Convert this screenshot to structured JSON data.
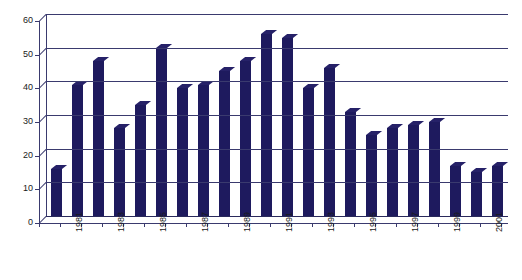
{
  "chart_data": {
    "type": "bar",
    "title": "",
    "subtitle": "",
    "xlabel": "",
    "ylabel": "",
    "categories": [
      "1980",
      "1981",
      "1982",
      "1983",
      "1984",
      "1985",
      "1986",
      "1987",
      "1988",
      "1989",
      "1990",
      "1991",
      "1992",
      "1993",
      "1994",
      "1995",
      "1996",
      "1997",
      "1998",
      "1999",
      "2000",
      "2001"
    ],
    "values": [
      14,
      39,
      46,
      26,
      33,
      50,
      38,
      39,
      43,
      46,
      54,
      53,
      38,
      44,
      31,
      24,
      26,
      27,
      28,
      15,
      13,
      15
    ],
    "ylim": [
      0,
      60
    ],
    "ytick_labels": [
      "0",
      "10",
      "20",
      "30",
      "40",
      "50",
      "60"
    ],
    "ytick_values": [
      0,
      10,
      20,
      30,
      40,
      50,
      60
    ],
    "visible_xtick_labels": [
      "1981",
      "1983",
      "1985",
      "1987",
      "1989",
      "1991",
      "1993",
      "1995",
      "1997",
      "1999",
      "2001"
    ],
    "grid": true,
    "legend": false,
    "legend_position": "none",
    "series": [
      {
        "name": "",
        "values": [
          14,
          39,
          46,
          26,
          33,
          50,
          38,
          39,
          43,
          46,
          54,
          53,
          38,
          44,
          31,
          24,
          26,
          27,
          28,
          15,
          13,
          15
        ]
      }
    ],
    "colors": {
      "bar": "#1e1a5e",
      "bar_top": "#262168",
      "gridline": "#3a3a6e",
      "axis": "#3a3a6e",
      "text": "#1a1a1a",
      "background": "#ffffff"
    }
  }
}
